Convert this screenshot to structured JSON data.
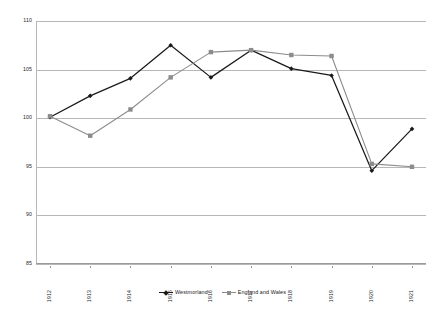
{
  "chart_data": {
    "type": "line",
    "title": "",
    "subtitle": "",
    "xlabel": "",
    "ylabel": "",
    "x": [
      "1912",
      "1913",
      "1914",
      "1915",
      "1916",
      "1917",
      "1918",
      "1919",
      "1920",
      "1921"
    ],
    "categories": [
      "1912",
      "1913",
      "1914",
      "1915",
      "1916",
      "1917",
      "1918",
      "1919",
      "1920",
      "1921"
    ],
    "ylim": [
      85,
      110
    ],
    "yticks": [
      85,
      90,
      95,
      100,
      105,
      110
    ],
    "ytick_labels": [
      "85",
      "90",
      "95",
      "100",
      "105",
      "110"
    ],
    "grid": "horizontal",
    "legend_position": "bottom",
    "series": [
      {
        "name": "Westmorland",
        "color": "#1a1a1a",
        "marker": "diamond",
        "values": [
          100.1,
          102.3,
          104.1,
          107.5,
          104.2,
          107.0,
          105.1,
          104.4,
          94.6,
          98.9
        ]
      },
      {
        "name": "England and Wales",
        "color": "#8c8c8c",
        "marker": "square",
        "values": [
          100.2,
          98.2,
          100.9,
          104.2,
          106.8,
          107.0,
          106.5,
          106.4,
          95.3,
          95.0
        ]
      }
    ]
  },
  "legend": {
    "items": [
      {
        "label": "Westmorland"
      },
      {
        "label": "England and Wales"
      }
    ]
  },
  "colors": {
    "series_1": "#1a1a1a",
    "series_2": "#8c8c8c",
    "gridline": "#b7b7b7",
    "axis": "#9a9a9a",
    "background": "#ffffff"
  }
}
